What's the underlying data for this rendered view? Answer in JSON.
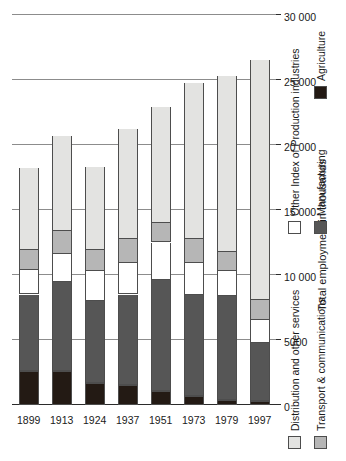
{
  "chart_data": {
    "type": "bar",
    "orientation": "vertical-stacked",
    "title": "",
    "xlabel": "",
    "ylabel": "Total employment in thousands",
    "categories": [
      "1899",
      "1913",
      "1924",
      "1937",
      "1951",
      "1973",
      "1979",
      "1997"
    ],
    "ylim": [
      0,
      30000
    ],
    "yticks": [
      0,
      5000,
      10000,
      15000,
      20000,
      25000,
      30000
    ],
    "ytick_labels": [
      "0",
      "5000",
      "10 000",
      "15 000",
      "20 000",
      "25 000",
      "30 000"
    ],
    "grid": true,
    "legend_position": "below-left",
    "stack_order_from_axis": [
      "Agriculture",
      "Manufacturing",
      "Other Index of Production industries",
      "Transport & communications",
      "Distribution and other services"
    ],
    "series": [
      {
        "name": "Agriculture",
        "color": "#231a14",
        "values": [
          2600,
          2600,
          1700,
          1550,
          1100,
          700,
          400,
          300
        ]
      },
      {
        "name": "Manufacturing",
        "color": "#565656",
        "values": [
          5900,
          6850,
          6300,
          6950,
          8550,
          7750,
          8000,
          4500
        ]
      },
      {
        "name": "Other Index of Production industries",
        "color": "#ffffff",
        "values": [
          1900,
          2200,
          2300,
          2400,
          2850,
          2450,
          1900,
          1750
        ]
      },
      {
        "name": "Transport & communications",
        "color": "#b6b6b6",
        "values": [
          1500,
          1700,
          1600,
          1900,
          1500,
          1900,
          1500,
          1500
        ]
      },
      {
        "name": "Distribution and other services",
        "color": "#e3e3e1",
        "values": [
          6350,
          7350,
          6400,
          8400,
          8950,
          12000,
          13500,
          18500
        ]
      }
    ],
    "totals": [
      18250,
      20700,
      18300,
      21200,
      22950,
      24800,
      25300,
      26550
    ]
  },
  "legend": {
    "items": [
      {
        "label": "Distribution and other services",
        "color": "#e3e3e1"
      },
      {
        "label": "Other Index of Production industries",
        "color": "#ffffff"
      },
      {
        "label": "Transport & communications",
        "color": "#b6b6b6"
      },
      {
        "label": "Manufacturing",
        "color": "#565656"
      },
      {
        "label": "Agriculture",
        "color": "#231a14"
      }
    ]
  },
  "axis": {
    "value_axis_title": "Total employment in thousands"
  }
}
